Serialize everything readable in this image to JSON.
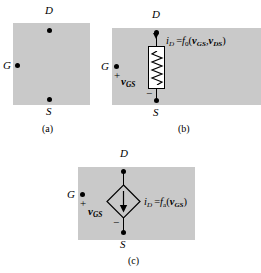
{
  "figure": {
    "background_color": "#ffffff",
    "panel_fill_color": "#c9c9c9",
    "line_color": "#000000"
  },
  "panels": [
    {
      "id": "a",
      "caption": "(a)",
      "description": "Three-terminal device symbol box with D, G, S terminals",
      "terminals": [
        {
          "name": "D",
          "label": "D",
          "position": "top"
        },
        {
          "name": "G",
          "label": "G",
          "position": "left"
        },
        {
          "name": "S",
          "label": "S",
          "position": "bottom"
        }
      ]
    },
    {
      "id": "b",
      "caption": "(b)",
      "description": "Equivalent circuit with controlled resistor between drain and source",
      "terminals": [
        {
          "name": "D",
          "label": "D",
          "position": "top"
        },
        {
          "name": "G",
          "label": "G",
          "position": "left"
        },
        {
          "name": "S",
          "label": "S",
          "position": "bottom"
        }
      ],
      "signs": {
        "plus": "+",
        "minus": "−"
      },
      "voltage_label": {
        "symbol": "v",
        "subscript": "GS"
      },
      "equation": {
        "current": "i",
        "current_subscript": "D",
        "equals": "=",
        "function": "f",
        "function_subscript": "0",
        "open_paren": "(",
        "arg1": "v",
        "arg1_subscript": "GS",
        "comma": ",",
        "arg2": "v",
        "arg2_subscript": "DS",
        "close_paren": ")"
      },
      "element": "resistor",
      "current_direction": "down"
    },
    {
      "id": "c",
      "caption": "(c)",
      "description": "Equivalent circuit with voltage-controlled current source between drain and source",
      "terminals": [
        {
          "name": "D",
          "label": "D",
          "position": "top"
        },
        {
          "name": "G",
          "label": "G",
          "position": "left"
        },
        {
          "name": "S",
          "label": "S",
          "position": "bottom"
        }
      ],
      "signs": {
        "plus": "+",
        "minus": "−"
      },
      "voltage_label": {
        "symbol": "v",
        "subscript": "GS"
      },
      "equation": {
        "current": "i",
        "current_subscript": "D",
        "equals": "=",
        "function": "f",
        "function_subscript": "a",
        "open_paren": "(",
        "arg1": "v",
        "arg1_subscript": "GS",
        "close_paren": ")"
      },
      "element": "dependent-current-source",
      "current_direction": "down"
    }
  ]
}
